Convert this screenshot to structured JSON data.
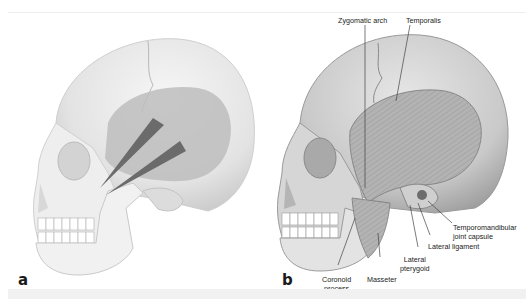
{
  "figure": {
    "panels": [
      {
        "id": "a",
        "letter": "a",
        "description": "Lateral skull with temporal fossa shaded and arrows indicating temporalis pull direction"
      },
      {
        "id": "b",
        "letter": "b",
        "description": "Lateral skull with temporalis, masseter and TMJ structures labeled",
        "labels": {
          "zygomatic_arch": "Zygomatic arch",
          "temporalis": "Temporalis",
          "tmj_capsule_line1": "Temporomandibular",
          "tmj_capsule_line2": "joint capsule",
          "lateral_ligament": "Lateral ligament",
          "lateral_pterygoid_line1": "Lateral",
          "lateral_pterygoid_line2": "pterygoid",
          "masseter": "Masseter",
          "coronoid_line1": "Coronoid",
          "coronoid_line2": "process"
        }
      }
    ]
  },
  "colors": {
    "bone_light": "#ececec",
    "bone_shadow": "#c8c8c8",
    "fossa_shade": "#b9b9b9",
    "arrow": "#6a6a6a",
    "muscle": "#a8a8a8",
    "leader_line": "#444444"
  }
}
